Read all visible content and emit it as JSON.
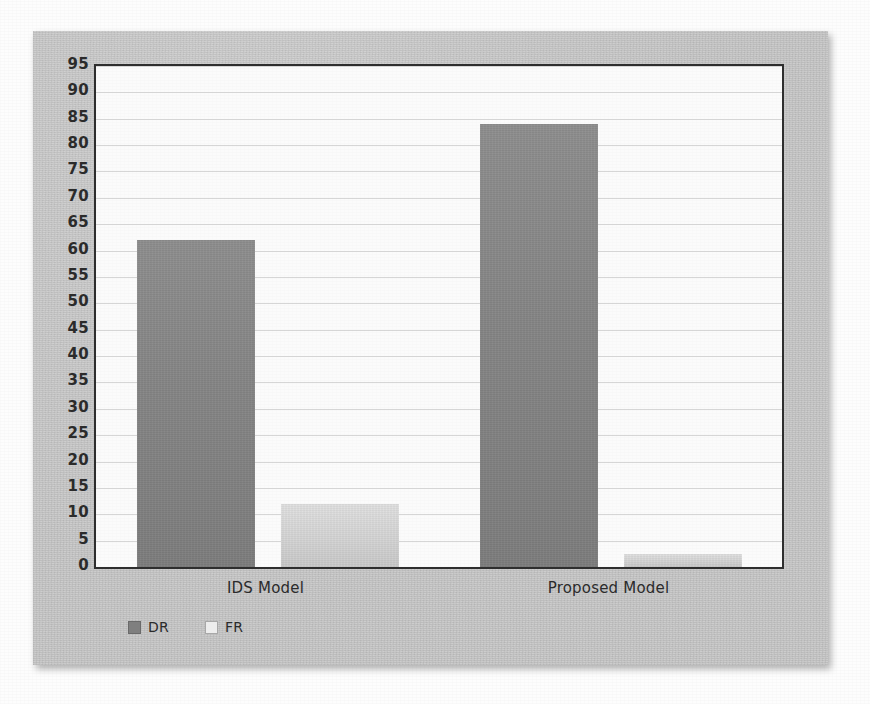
{
  "chart_data": {
    "type": "bar",
    "title": "",
    "xlabel": "",
    "ylabel": "",
    "categories": [
      "IDS Model",
      "Proposed Model"
    ],
    "series": [
      {
        "name": "DR",
        "values": [
          62,
          84
        ],
        "color": "#858585"
      },
      {
        "name": "FR",
        "values": [
          12,
          2.5
        ],
        "color": "#d4d4d4"
      }
    ],
    "ylim": [
      0,
      95
    ],
    "ytick_step": 5,
    "yticks": [
      95,
      90,
      85,
      80,
      75,
      70,
      65,
      60,
      55,
      50,
      45,
      40,
      35,
      30,
      25,
      20,
      15,
      10,
      5,
      0
    ],
    "grid": true,
    "legend_position": "bottom-left",
    "legend": [
      "DR",
      "FR"
    ],
    "plot_background": "#fbfbfb",
    "frame_color": "#2e2e2e",
    "card_background": "#c9c9c9"
  },
  "figure": {
    "card_label": "bar-chart-figure",
    "axis_label_color": "#2b2b2b"
  }
}
